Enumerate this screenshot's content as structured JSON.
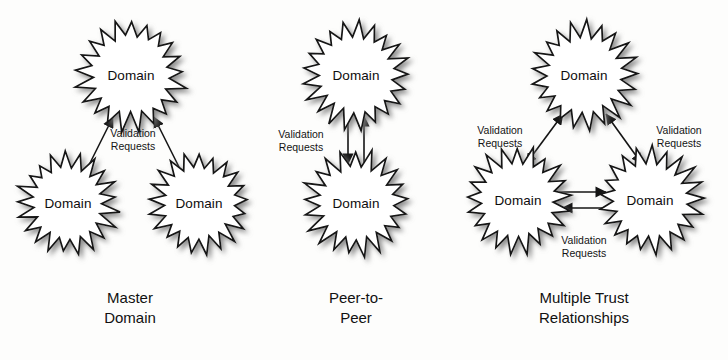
{
  "diagram": {
    "title_implicit": "Domain Trust Relationship Models",
    "background_color": "#fdfdfc",
    "line_color": "#141414",
    "node_fill": "#ffffff",
    "node_label": "Domain",
    "edge_label_line1": "Validation",
    "edge_label_line2": "Requests"
  },
  "panels": [
    {
      "id": "master-domain",
      "caption_line1": "Master",
      "caption_line2": "Domain",
      "caption_x": 130,
      "caption_y": 288,
      "nodes": [
        {
          "name": "master-top-domain",
          "label": "Domain",
          "cx": 131,
          "cy": 75,
          "r": 55
        },
        {
          "name": "master-left-domain",
          "label": "Domain",
          "cx": 68,
          "cy": 203,
          "r": 50
        },
        {
          "name": "master-right-domain",
          "label": "Domain",
          "cx": 199,
          "cy": 203,
          "r": 50
        }
      ],
      "edges": [
        {
          "name": "edge-left-to-top",
          "kind": "single",
          "x1": 86,
          "y1": 171,
          "x2": 113,
          "y2": 117
        },
        {
          "name": "edge-right-to-top",
          "kind": "single",
          "x1": 181,
          "y1": 171,
          "x2": 154,
          "y2": 117
        }
      ],
      "edge_labels": [
        {
          "name": "label-master-validation",
          "line1": "Validation",
          "line2": "Requests",
          "x": 133,
          "y": 139
        }
      ]
    },
    {
      "id": "peer-to-peer",
      "caption_line1": "Peer-to-",
      "caption_line2": "Peer",
      "caption_x": 356,
      "caption_y": 288,
      "nodes": [
        {
          "name": "peer-top-domain",
          "label": "Domain",
          "cx": 356,
          "cy": 75,
          "r": 53
        },
        {
          "name": "peer-bottom-domain",
          "label": "Domain",
          "cx": 356,
          "cy": 203,
          "r": 52
        }
      ],
      "edges": [
        {
          "name": "edge-peer-down",
          "kind": "single",
          "x1": 348,
          "y1": 116,
          "x2": 348,
          "y2": 164
        },
        {
          "name": "edge-peer-up",
          "kind": "single",
          "x1": 364,
          "y1": 164,
          "x2": 364,
          "y2": 116
        }
      ],
      "edge_labels": [
        {
          "name": "label-peer-validation",
          "line1": "Validation",
          "line2": "Requests",
          "x": 301,
          "y": 140
        }
      ]
    },
    {
      "id": "multiple-trust-relationships",
      "caption_line1": "Multiple Trust",
      "caption_line2": "Relationships",
      "caption_x": 584,
      "caption_y": 288,
      "nodes": [
        {
          "name": "trust-top-domain",
          "label": "Domain",
          "cx": 584,
          "cy": 75,
          "r": 53
        },
        {
          "name": "trust-left-domain",
          "label": "Domain",
          "cx": 518,
          "cy": 200,
          "r": 52
        },
        {
          "name": "trust-right-domain",
          "label": "Domain",
          "cx": 650,
          "cy": 200,
          "r": 52
        }
      ],
      "edges": [
        {
          "name": "edge-left-top-double",
          "kind": "double",
          "x1": 526,
          "y1": 164,
          "x2": 563,
          "y2": 114
        },
        {
          "name": "edge-right-top-double",
          "kind": "double",
          "x1": 642,
          "y1": 164,
          "x2": 606,
          "y2": 114
        },
        {
          "name": "edge-left-to-right",
          "kind": "single",
          "x1": 559,
          "y1": 192,
          "x2": 606,
          "y2": 192
        },
        {
          "name": "edge-right-to-left",
          "kind": "single",
          "x1": 609,
          "y1": 208,
          "x2": 562,
          "y2": 208
        }
      ],
      "edge_labels": [
        {
          "name": "label-trust-left-validation",
          "line1": "Validation",
          "line2": "Requests",
          "x": 500,
          "y": 136
        },
        {
          "name": "label-trust-right-validation",
          "line1": "Validation",
          "line2": "Requests",
          "x": 679,
          "y": 136
        },
        {
          "name": "label-trust-bottom-validation",
          "line1": "Validation",
          "line2": "Requests",
          "x": 584,
          "y": 246
        }
      ]
    }
  ]
}
